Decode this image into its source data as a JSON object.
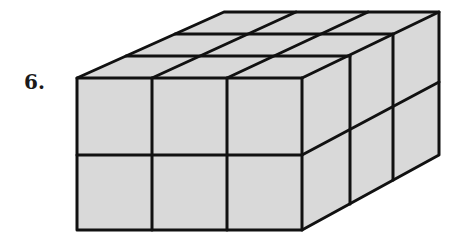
{
  "problem": {
    "number_label": "6.",
    "figure": "rectangular prism made of unit cubes",
    "dimensions": {
      "length": 3,
      "width": 3,
      "height": 2
    }
  },
  "colors": {
    "face_fill": "#d9d9d9",
    "edge_stroke": "#111111",
    "background": "#ffffff"
  }
}
